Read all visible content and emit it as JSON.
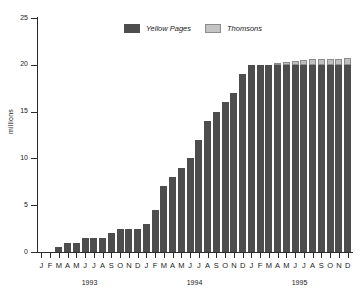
{
  "chart_data": {
    "type": "bar",
    "stacked": true,
    "title": "",
    "xlabel": "",
    "ylabel": "millions",
    "ylim": [
      0,
      25
    ],
    "yticks": [
      0,
      5,
      10,
      15,
      20,
      25
    ],
    "ytick_labels": [
      "0",
      "5",
      "10",
      "15",
      "20",
      "25"
    ],
    "grid": false,
    "legend_position": "top-center",
    "categories": [
      "J",
      "F",
      "M",
      "A",
      "M",
      "J",
      "J",
      "A",
      "S",
      "O",
      "N",
      "D",
      "J",
      "F",
      "M",
      "A",
      "M",
      "J",
      "J",
      "A",
      "S",
      "O",
      "N",
      "D",
      "J",
      "F",
      "M",
      "A",
      "M",
      "J",
      "J",
      "A",
      "S",
      "O",
      "N",
      "D"
    ],
    "group_labels": [
      "1993",
      "1994",
      "1995"
    ],
    "series": [
      {
        "name": "Yellow Pages",
        "color": "#4d4d4d",
        "values": [
          0,
          0,
          0.5,
          1.0,
          1.0,
          1.5,
          1.5,
          1.5,
          2.0,
          2.5,
          2.5,
          2.5,
          3.0,
          4.5,
          7.0,
          8.0,
          9.0,
          10.0,
          12.0,
          14.0,
          15.0,
          16.0,
          17.0,
          19.0,
          20.0,
          20.0,
          20.0,
          20.0,
          20.0,
          20.0,
          20.0,
          20.0,
          20.0,
          20.0,
          20.0,
          20.0
        ]
      },
      {
        "name": "Thomsons",
        "color": "#c4c4c4",
        "values": [
          0,
          0,
          0,
          0,
          0,
          0,
          0,
          0,
          0,
          0,
          0,
          0,
          0,
          0,
          0,
          0,
          0,
          0,
          0,
          0,
          0,
          0,
          0,
          0,
          0,
          0,
          0,
          0.15,
          0.3,
          0.45,
          0.55,
          0.6,
          0.65,
          0.65,
          0.65,
          0.7
        ]
      }
    ]
  },
  "legend": {
    "entries": [
      {
        "label": "Yellow Pages"
      },
      {
        "label": "Thomsons"
      }
    ]
  },
  "axes": {
    "y_title": "millions"
  }
}
